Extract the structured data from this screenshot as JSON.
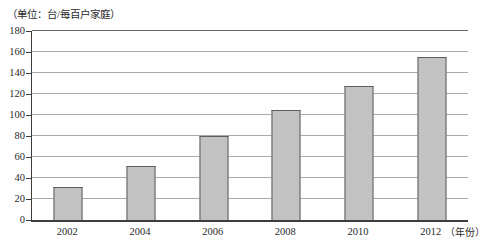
{
  "chart_data": {
    "type": "bar",
    "title_unit": "（单位：台/每百户家庭）",
    "categories": [
      "2002",
      "2004",
      "2006",
      "2008",
      "2010",
      "2012"
    ],
    "values": [
      31,
      51,
      80,
      105,
      128,
      155
    ],
    "xlabel_suffix": "（年份）",
    "xlabel": "年份",
    "ylabel": "台/每百户家庭",
    "ylim": [
      0,
      180
    ],
    "yticks": [
      0,
      20,
      40,
      60,
      80,
      100,
      120,
      140,
      160,
      180
    ],
    "grid": true,
    "legend": "none",
    "colors": {
      "bar_fill": "#c2c2c2",
      "bar_border": "#5e5e5e",
      "gridline": "#ababab",
      "axis": "#3d3d3d",
      "text": "#2b2b2b"
    }
  }
}
